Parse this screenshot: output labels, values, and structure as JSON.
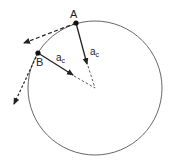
{
  "diagram": {
    "points": [
      {
        "id": "A",
        "label": "A"
      },
      {
        "id": "B",
        "label": "B"
      }
    ],
    "vectors": [
      {
        "from": "A",
        "label_main": "a",
        "label_sub": "c",
        "kind": "centripetal"
      },
      {
        "from": "B",
        "label_main": "a",
        "label_sub": "c",
        "kind": "centripetal"
      }
    ],
    "colors": {
      "stroke": "#222222",
      "circle": "#555555",
      "background": "#ffffff"
    }
  }
}
